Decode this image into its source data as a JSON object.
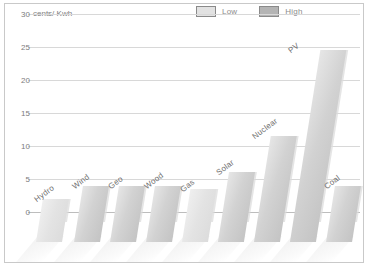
{
  "legend": {
    "position": "top-right",
    "items": [
      {
        "label": "Low",
        "color": "#e2e2e2",
        "swatch": "low-swatch"
      },
      {
        "label": "High",
        "color": "#b4b4b4",
        "swatch": "high-swatch"
      }
    ]
  },
  "axis": {
    "unit_label": "cents/ Kwh",
    "y_ticks": [
      "30",
      "25",
      "20",
      "15",
      "10",
      "5",
      "0"
    ]
  },
  "chart_data": {
    "type": "bar",
    "title": "",
    "subtitle": "",
    "xlabel": "",
    "ylabel": "cents/ Kwh",
    "ylim": [
      0,
      30
    ],
    "yticks": [
      0,
      5,
      10,
      15,
      20,
      25,
      30
    ],
    "grid": true,
    "legend_position": "top-right",
    "categories": [
      "Hydro",
      "Wind",
      "Geo",
      "Wood",
      "Gas",
      "Solar",
      "Nuclear",
      "PV",
      "Coal"
    ],
    "series": [
      {
        "name": "Low",
        "values": [
          2.0,
          4.0,
          4.0,
          4.0,
          3.5,
          6.0,
          11.5,
          24.5,
          4.0
        ]
      },
      {
        "name": "High",
        "values": [
          2.0,
          4.0,
          4.0,
          4.0,
          3.5,
          6.0,
          11.5,
          24.5,
          4.0
        ]
      }
    ],
    "values": [
      2.0,
      4.0,
      4.0,
      4.0,
      3.5,
      6.0,
      11.5,
      24.5,
      4.0
    ],
    "annotations": []
  },
  "bars": [
    {
      "label": "Hydro",
      "value": 2.0,
      "x": 36,
      "width": 26,
      "shade": "light"
    },
    {
      "label": "Wind",
      "value": 4.0,
      "x": 74,
      "width": 26,
      "shade": "mid"
    },
    {
      "label": "Geo",
      "value": 4.0,
      "x": 110,
      "width": 26,
      "shade": "mid"
    },
    {
      "label": "Wood",
      "value": 4.0,
      "x": 146,
      "width": 26,
      "shade": "mid"
    },
    {
      "label": "Gas",
      "value": 3.5,
      "x": 182,
      "width": 26,
      "shade": "light"
    },
    {
      "label": "Solar",
      "value": 6.0,
      "x": 218,
      "width": 26,
      "shade": "mid"
    },
    {
      "label": "Nuclear",
      "value": 11.5,
      "x": 254,
      "width": 26,
      "shade": "mid"
    },
    {
      "label": "PV",
      "value": 24.5,
      "x": 290,
      "width": 26,
      "shade": "mid"
    },
    {
      "label": "Coal",
      "value": 4.0,
      "x": 326,
      "width": 26,
      "shade": "mid"
    }
  ]
}
